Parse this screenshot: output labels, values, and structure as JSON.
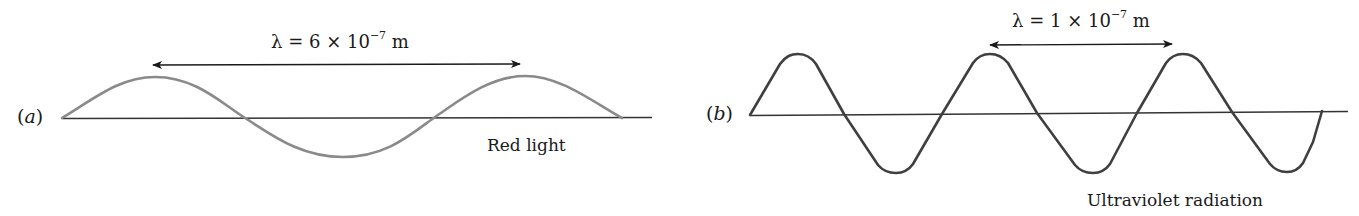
{
  "figure": {
    "panel_a": {
      "label_open": "(",
      "label_letter": "a",
      "label_close": ")",
      "wavelength": {
        "symbol": "λ",
        "equals": "=",
        "coefficient": "6",
        "times": "×",
        "base": "10",
        "exponent": "−7",
        "unit": "m"
      },
      "caption": "Red light",
      "wave_color": "#8a8a8a",
      "cycles_shown": 1.5
    },
    "panel_b": {
      "label_open": "(",
      "label_letter": "b",
      "label_close": ")",
      "wavelength": {
        "symbol": "λ",
        "equals": "=",
        "coefficient": "1",
        "times": "×",
        "base": "10",
        "exponent": "−7",
        "unit": "m"
      },
      "caption": "Ultraviolet radiation",
      "wave_color": "#3f3f3f",
      "cycles_shown": 2.75
    },
    "axis_color": "#333333",
    "arrow_color": "#1a1a1a"
  }
}
